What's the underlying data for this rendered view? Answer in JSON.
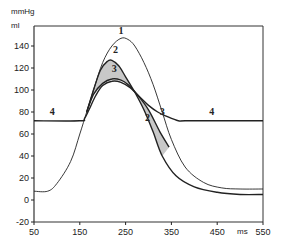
{
  "chart_data": {
    "type": "line",
    "title": "",
    "xlabel": "ms",
    "ylabel_top": "mmHg",
    "ylabel_bottom": "ml",
    "xlim": [
      50,
      550
    ],
    "ylim": [
      -20,
      155
    ],
    "grid": false,
    "legend": "none (curves labeled inline 1-4)",
    "x_ticks": [
      50,
      150,
      250,
      350,
      450,
      550
    ],
    "y_ticks": [
      -20,
      0,
      20,
      40,
      60,
      80,
      100,
      120,
      140
    ],
    "colors": {
      "line": "#222222",
      "shade": "#c8c8c8",
      "frame": "#333333"
    },
    "series": [
      {
        "name": "1",
        "description": "tallest pressure curve",
        "points": [
          [
            50,
            8
          ],
          [
            80,
            8
          ],
          [
            100,
            15
          ],
          [
            130,
            35
          ],
          [
            150,
            60
          ],
          [
            165,
            80
          ],
          [
            180,
            100
          ],
          [
            200,
            125
          ],
          [
            220,
            140
          ],
          [
            240,
            147
          ],
          [
            255,
            146
          ],
          [
            270,
            140
          ],
          [
            290,
            125
          ],
          [
            310,
            105
          ],
          [
            330,
            80
          ],
          [
            350,
            55
          ],
          [
            380,
            30
          ],
          [
            420,
            16
          ],
          [
            460,
            11
          ],
          [
            500,
            10
          ],
          [
            550,
            10
          ]
        ]
      },
      {
        "name": "2",
        "description": "second pressure curve (peak ~127)",
        "points": [
          [
            165,
            80
          ],
          [
            180,
            100
          ],
          [
            195,
            118
          ],
          [
            210,
            126
          ],
          [
            220,
            127
          ],
          [
            235,
            122
          ],
          [
            250,
            112
          ],
          [
            270,
            98
          ],
          [
            290,
            82
          ],
          [
            310,
            62
          ],
          [
            330,
            40
          ],
          [
            360,
            22
          ],
          [
            400,
            12
          ],
          [
            450,
            7
          ],
          [
            500,
            5
          ],
          [
            550,
            5
          ]
        ]
      },
      {
        "name": "3",
        "description": "third curve (peak ~110), shaded region between 2 and 3",
        "points": [
          [
            165,
            80
          ],
          [
            180,
            96
          ],
          [
            200,
            106
          ],
          [
            220,
            110
          ],
          [
            240,
            109
          ],
          [
            255,
            105
          ],
          [
            275,
            96
          ],
          [
            300,
            82
          ],
          [
            325,
            62
          ],
          [
            345,
            48
          ]
        ]
      },
      {
        "name": "4",
        "description": "baseline curve ~72 then hump",
        "points": [
          [
            50,
            72
          ],
          [
            150,
            72
          ],
          [
            160,
            74
          ],
          [
            170,
            82
          ],
          [
            185,
            95
          ],
          [
            200,
            104
          ],
          [
            220,
            108
          ],
          [
            240,
            107
          ],
          [
            260,
            102
          ],
          [
            280,
            94
          ],
          [
            300,
            86
          ],
          [
            320,
            80
          ],
          [
            340,
            76
          ],
          [
            365,
            72
          ],
          [
            380,
            72
          ],
          [
            450,
            72
          ],
          [
            550,
            72
          ]
        ]
      }
    ],
    "inline_labels": [
      {
        "text": "1",
        "x": 240,
        "y": 151
      },
      {
        "text": "2",
        "x": 228,
        "y": 134
      },
      {
        "text": "3",
        "x": 225,
        "y": 116
      },
      {
        "text": "4",
        "x": 90,
        "y": 77
      },
      {
        "text": "3",
        "x": 330,
        "y": 77
      },
      {
        "text": "2",
        "x": 298,
        "y": 72
      },
      {
        "text": "4",
        "x": 438,
        "y": 77
      }
    ]
  }
}
